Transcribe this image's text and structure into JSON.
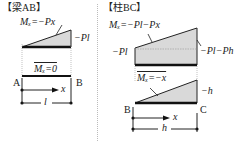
{
  "colors": {
    "fill": "#d9d9d9",
    "line": "#222222",
    "divider": "#bbbbbb"
  },
  "beam_ab": {
    "header": "【梁AB】",
    "moment_eq": "Mₓ=−Px",
    "end_value": "−Pl",
    "virtual_moment": "Mₓ=0",
    "node_a": "A",
    "node_b": "B",
    "axis_label": "x",
    "length_label": "l"
  },
  "column_bc": {
    "header": "【柱BC】",
    "moment_eq": "Mₓ=−Pl−Px",
    "left_value": "−Pl",
    "right_value": "−Pl−Ph",
    "virtual_moment": "Mₓ=−x",
    "virtual_end_value": "−h",
    "node_b": "B",
    "node_c": "C",
    "axis_label": "x",
    "length_label": "h"
  }
}
